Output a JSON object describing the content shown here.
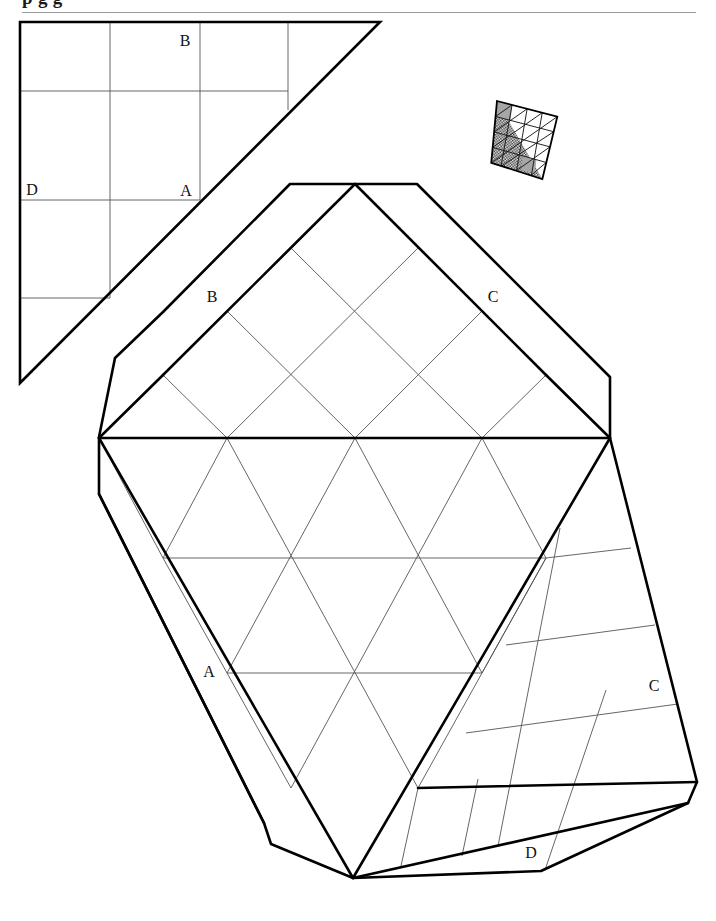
{
  "page": {
    "width": 716,
    "height": 921,
    "background": "#ffffff",
    "ink": "#000000",
    "thin_line_color": "#555555",
    "rule_color": "#9a9a9a",
    "clipped_title_fragment": "p    g  g"
  },
  "figures": {
    "grid_square": {
      "name": "square-grid-triangle",
      "description": "Right triangle half of a 4x4 square grid, upper-left of page",
      "labels": [
        {
          "text": "B",
          "x": 185,
          "y": 46
        },
        {
          "text": "A",
          "x": 186,
          "y": 196
        },
        {
          "text": "D",
          "x": 32,
          "y": 195
        }
      ],
      "grid_columns": 4,
      "grid_rows": 4
    },
    "small_patch": {
      "name": "shaded-tessellation-patch",
      "description": "Small skewed 4x4 quadrilateral patch, half hatched/shaded, upper-right of page",
      "shaded_fill": "#8f8f8f",
      "light_fill": "#ffffff"
    },
    "main_pattern": {
      "name": "main-crease-pattern",
      "description": "Large folded crease pattern with triangular lattice core, diamond lattice top and square-grid side flaps",
      "labels": [
        {
          "text": "B",
          "x": 212,
          "y": 302
        },
        {
          "text": "C",
          "x": 493,
          "y": 302
        },
        {
          "text": "A",
          "x": 209,
          "y": 677
        },
        {
          "text": "C",
          "x": 654,
          "y": 691
        },
        {
          "text": "D",
          "x": 531,
          "y": 858
        }
      ]
    }
  }
}
